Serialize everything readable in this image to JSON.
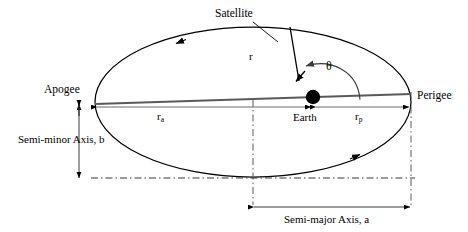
{
  "diagram": {
    "labels": {
      "satellite": "Satellite",
      "apogee": "Apogee",
      "perigee": "Perigee",
      "earth": "Earth",
      "radius_vector": "r",
      "true_anomaly": "θ",
      "apogee_radius": "r",
      "apogee_radius_sub": "a",
      "perigee_radius": "r",
      "perigee_radius_sub": "p",
      "semi_minor_axis": "Semi-minor Axis, b",
      "semi_major_axis": "Semi-major Axis, a"
    },
    "colors": {
      "background": "#ffffff",
      "stroke": "#000000",
      "dimension_line": "#4d4d4d",
      "axis_line": "#555555",
      "earth_body": "#000000"
    },
    "geometry": {
      "ellipse_center_x": 253,
      "ellipse_center_y": 102,
      "semi_major_px": 158,
      "semi_minor_px": 75,
      "earth_focus_x": 313,
      "earth_focus_y": 97,
      "earth_radius_px": 7,
      "satellite_x": 290,
      "satellite_y": 27,
      "orbit_direction": "counter-clockwise"
    }
  }
}
